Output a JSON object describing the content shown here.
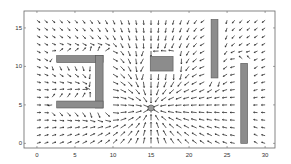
{
  "chart_data": {
    "type": "quiver",
    "title": "",
    "xlabel": "",
    "ylabel": "",
    "xlim": [
      -1.7,
      31.3
    ],
    "ylim": [
      -0.6,
      17.2
    ],
    "xticks": [
      0,
      5,
      10,
      15,
      20,
      25,
      30
    ],
    "yticks": [
      0,
      5,
      10,
      15
    ],
    "grid": false,
    "legend": null,
    "field": {
      "description": "Potential-field vector plot: arrows attracted toward goal, deflected around obstacles",
      "x_range": [
        0,
        30
      ],
      "y_range": [
        0,
        16
      ],
      "step": 1
    },
    "goal": {
      "x": 15,
      "y": 4.6,
      "label": "goal"
    },
    "obstacles": [
      {
        "name": "u-top-bar",
        "x0": 2.6,
        "x1": 8.7,
        "y0": 10.5,
        "y1": 11.4
      },
      {
        "name": "u-right-bar",
        "x0": 7.7,
        "x1": 8.7,
        "y0": 4.6,
        "y1": 11.4
      },
      {
        "name": "u-bottom-bar",
        "x0": 2.6,
        "x1": 8.7,
        "y0": 4.6,
        "y1": 5.5
      },
      {
        "name": "center-block",
        "x0": 14.9,
        "x1": 17.9,
        "y0": 9.4,
        "y1": 11.3
      },
      {
        "name": "upper-right-pillar",
        "x0": 22.9,
        "x1": 23.8,
        "y0": 8.5,
        "y1": 16.1
      },
      {
        "name": "lower-right-pillar",
        "x0": 26.8,
        "x1": 27.7,
        "y0": 0.0,
        "y1": 10.4
      }
    ],
    "colors": {
      "arrow": "#1a1a1a",
      "obstacle_fill": "#8c8c8c",
      "obstacle_stroke": "#555555",
      "goal_fill": "#9a9a9a",
      "axes": "#666666"
    }
  }
}
